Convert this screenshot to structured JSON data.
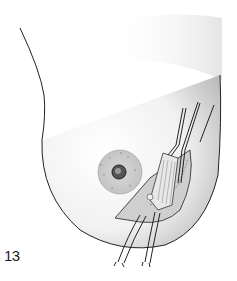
{
  "figure": {
    "number": "13"
  },
  "colors": {
    "outline": "#222222",
    "skin_shade": "#d8d8d8",
    "areola": "#c9c9c9",
    "background": "#ffffff"
  }
}
